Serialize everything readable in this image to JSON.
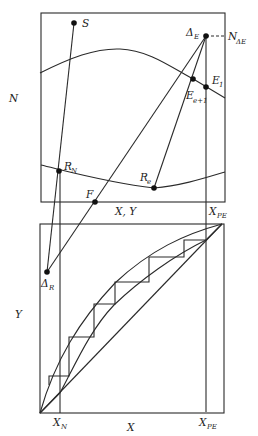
{
  "diagram": {
    "type": "Ponchon-Savarit / Janecke extraction construction",
    "top_panel": {
      "y_axis_label": "N",
      "x_axis_label": "X, Y",
      "points": {
        "S": "S",
        "delta_E": "Δ",
        "delta_E_sub": "E",
        "N_delta_E": "N",
        "N_delta_E_sub": "ΔE",
        "E1": "E",
        "E1_sub": "1",
        "Ee1": "E",
        "Ee1_sub": "e+1",
        "RN": "R",
        "RN_sub": "N",
        "Re": "R",
        "Re_sub": "e",
        "F": "F"
      },
      "x_marker": "X",
      "x_marker_sub": "PE"
    },
    "bottom_panel": {
      "y_axis_label": "Y",
      "x_axis_label": "X",
      "delta_R": "Δ",
      "delta_R_sub": "R",
      "x_ticks": [
        {
          "main": "X",
          "sub": "N"
        },
        {
          "main": "X",
          "sub": "PE"
        }
      ]
    },
    "colors": {
      "line": "#2a2a2a",
      "point": "#111111",
      "background": "#ffffff"
    }
  }
}
